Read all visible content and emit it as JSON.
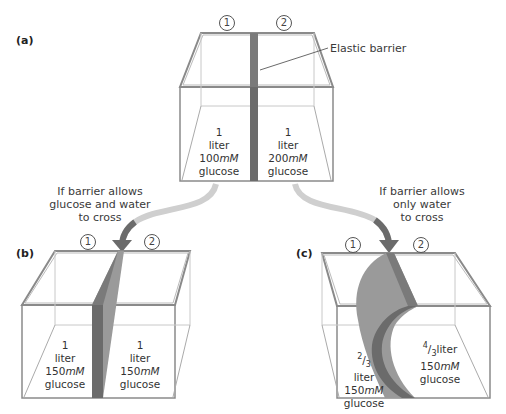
{
  "colors": {
    "barrier_dark": "#6b6b6b",
    "barrier_light": "#9a9a9a",
    "outline": "#8a8a8a",
    "text": "#3a3a3a"
  },
  "panel_a": {
    "label": "(a)",
    "side_1": "1",
    "side_2": "2",
    "barrier_callout": "Elastic barrier",
    "left": {
      "volume_num": "1",
      "volume_unit": "liter",
      "conc_num": "100",
      "conc_unit": "mM",
      "solute": "glucose"
    },
    "right": {
      "volume_num": "1",
      "volume_unit": "liter",
      "conc_num": "200",
      "conc_unit": "mM",
      "solute": "glucose"
    }
  },
  "transition_b": {
    "caption_lines": [
      "If barrier allows",
      "glucose and water",
      "to cross"
    ]
  },
  "transition_c": {
    "caption_lines": [
      "If barrier allows",
      "only water",
      "to cross"
    ]
  },
  "panel_b": {
    "label": "(b)",
    "side_1": "1",
    "side_2": "2",
    "left": {
      "volume_num": "1",
      "volume_unit": "liter",
      "conc_num": "150",
      "conc_unit": "mM",
      "solute": "glucose"
    },
    "right": {
      "volume_num": "1",
      "volume_unit": "liter",
      "conc_num": "150",
      "conc_unit": "mM",
      "solute": "glucose"
    }
  },
  "panel_c": {
    "label": "(c)",
    "side_1": "1",
    "side_2": "2",
    "left": {
      "frac_num": "2",
      "frac_den": "3",
      "volume_unit": "liter",
      "conc_num": "150",
      "conc_unit": "mM",
      "solute": "glucose"
    },
    "right": {
      "frac_num": "4",
      "frac_den": "3",
      "volume_unit": "liter",
      "conc_num": "150",
      "conc_unit": "mM",
      "solute": "glucose"
    }
  }
}
